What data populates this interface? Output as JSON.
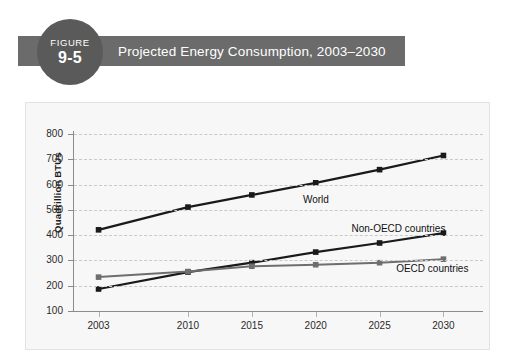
{
  "figure": {
    "badge_word": "FIGURE",
    "badge_number": "9-5",
    "title": "Projected Energy Consumption, 2003–2030",
    "band_color": "#6b6b6b",
    "badge_color": "#5a5a5a",
    "title_color": "#ffffff"
  },
  "panel": {
    "background": "#f7f7f7",
    "border_color": "#e2e2e2"
  },
  "chart_data": {
    "type": "line",
    "title": "Projected Energy Consumption, 2003–2030",
    "xlabel": "",
    "ylabel": "Quadrillion BTUs",
    "categories": [
      "2003",
      "2010",
      "2015",
      "2020",
      "2025",
      "2030"
    ],
    "x": [
      2003,
      2010,
      2015,
      2020,
      2025,
      2030
    ],
    "ylim": [
      100,
      800
    ],
    "xlim": [
      2001,
      2032
    ],
    "yticks": [
      100,
      200,
      300,
      400,
      500,
      600,
      700,
      800
    ],
    "ytick_labels": [
      "100",
      "200",
      "300",
      "400",
      "500",
      "600",
      "700",
      "800"
    ],
    "xticks": [
      2003,
      2010,
      2015,
      2020,
      2025,
      2030
    ],
    "xtick_labels": [
      "2003",
      "2010",
      "2015",
      "2020",
      "2025",
      "2030"
    ],
    "grid": true,
    "grid_axis": "y",
    "grid_style": "dashed",
    "grid_color": "#c9c9c9",
    "legend": "inline-labels",
    "marker": "square",
    "series": [
      {
        "name": "World",
        "values": [
          421,
          511,
          559,
          607,
          659,
          715
        ],
        "color": "#1a1a1a",
        "line_width": 2.2,
        "label_x": 2019.0,
        "label_y": 540
      },
      {
        "name": "Non-OECD countries",
        "values": [
          187,
          254,
          291,
          333,
          369,
          408
        ],
        "color": "#1a1a1a",
        "line_width": 2.2,
        "label_x": 2022.8,
        "label_y": 426
      },
      {
        "name": "OECD countries",
        "values": [
          234,
          256,
          277,
          283,
          291,
          305
        ],
        "color": "#6e6e6e",
        "line_width": 2.0,
        "label_x": 2026.3,
        "label_y": 268
      }
    ]
  }
}
